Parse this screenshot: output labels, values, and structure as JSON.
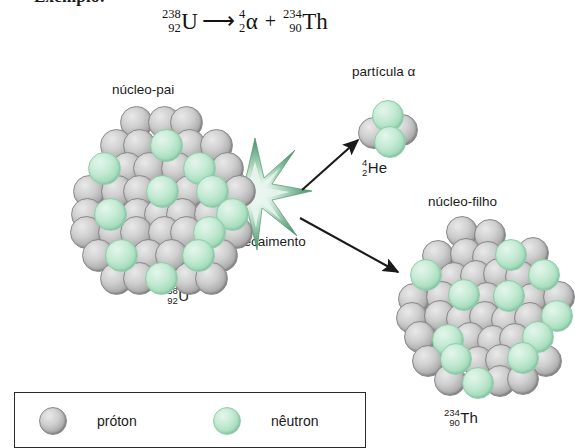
{
  "heading": "Exemplo:",
  "equation": {
    "parent": {
      "mass": "238",
      "atomic": "92",
      "symbol": "U"
    },
    "arrow": "⟶",
    "alpha": {
      "mass": "4",
      "atomic": "2",
      "symbol": "α"
    },
    "plus": "+",
    "daughter": {
      "mass": "234",
      "atomic": "90",
      "symbol": "Th"
    }
  },
  "labels": {
    "parent_nucleus": "núcleo-pai",
    "alpha_particle": "partícula α",
    "daughter_nucleus": "núcleo-filho",
    "decay": "decaimento"
  },
  "isotopes": {
    "parent": {
      "mass": "238",
      "atomic": "92",
      "symbol": "U"
    },
    "helium": {
      "mass": "4",
      "atomic": "2",
      "symbol": "He"
    },
    "thorium": {
      "mass": "234",
      "atomic": "90",
      "symbol": "Th"
    }
  },
  "legend": {
    "proton": {
      "label": "próton",
      "color": "#b8b8b8"
    },
    "neutron": {
      "label": "nêutron",
      "color": "#a9dcc0"
    }
  },
  "colors": {
    "proton": "#b8b8b8",
    "neutron": "#a9dcc0",
    "burst": "#4e9a6b",
    "arrow": "#1a1a1a",
    "text": "#1b1b1b"
  },
  "diagram": {
    "type": "alpha-decay",
    "parent_nucleons": {
      "protons_shown": 38,
      "neutrons_shown": 9
    },
    "alpha_nucleons": {
      "protons_shown": 2,
      "neutrons_shown": 2
    },
    "daughter_nucleons": {
      "protons_shown": 36,
      "neutrons_shown": 9
    }
  }
}
